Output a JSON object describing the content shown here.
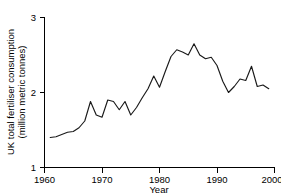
{
  "chart_data": {
    "type": "line",
    "title": "",
    "xlabel": "Year",
    "ylabel": "UK total fertiliser consumption (million metric tonnes)",
    "ylabel_line1": "UK total fertiliser consumption",
    "ylabel_line2": "(million metric tonnes)",
    "xlim": [
      1960,
      2000
    ],
    "ylim": [
      1,
      3
    ],
    "xticks": [
      1960,
      1970,
      1980,
      1990,
      2000
    ],
    "xtick_labels": [
      "1960",
      "1970",
      "1980",
      "1990",
      "2000"
    ],
    "yticks": [
      1,
      2,
      3
    ],
    "ytick_labels": [
      "1",
      "2",
      "3"
    ],
    "grid": false,
    "legend": false,
    "line_color": "#1a1a1a",
    "series": [
      {
        "name": "UK total fertiliser consumption",
        "x": [
          1961,
          1962,
          1963,
          1964,
          1965,
          1966,
          1967,
          1968,
          1969,
          1970,
          1971,
          1972,
          1973,
          1974,
          1975,
          1976,
          1977,
          1978,
          1979,
          1980,
          1981,
          1982,
          1983,
          1984,
          1985,
          1986,
          1987,
          1988,
          1989,
          1990,
          1991,
          1992,
          1993,
          1994,
          1995,
          1996,
          1997,
          1998,
          1999
        ],
        "values": [
          1.4,
          1.41,
          1.44,
          1.47,
          1.48,
          1.53,
          1.62,
          1.88,
          1.7,
          1.67,
          1.9,
          1.88,
          1.77,
          1.88,
          1.7,
          1.8,
          1.93,
          2.05,
          2.22,
          2.07,
          2.28,
          2.48,
          2.57,
          2.54,
          2.5,
          2.65,
          2.5,
          2.45,
          2.47,
          2.36,
          2.15,
          2.0,
          2.08,
          2.18,
          2.16,
          2.35,
          2.08,
          2.1,
          2.05
        ]
      }
    ]
  }
}
